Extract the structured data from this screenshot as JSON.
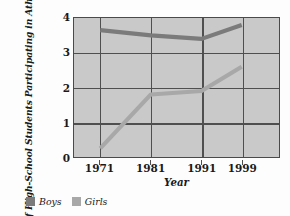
{
  "chart_data": {
    "type": "line",
    "title": "",
    "xlabel": "Year",
    "ylabel": "Number Of High-School Students Participating in Athletics (In Millions)",
    "x": [
      "1971",
      "1981",
      "1991",
      "1999"
    ],
    "categories": [
      "1971",
      "1981",
      "1991",
      "1999"
    ],
    "series": [
      {
        "name": "Boys",
        "values": [
          3.65,
          3.5,
          3.4,
          3.8
        ],
        "color": "#7b7b7b"
      },
      {
        "name": "Girls",
        "values": [
          0.25,
          1.8,
          1.9,
          2.6
        ],
        "color": "#a8a8a8"
      }
    ],
    "xlim": [
      1966,
      2004
    ],
    "ylim": [
      0,
      4
    ],
    "yticks": [
      "0",
      "1",
      "2",
      "3",
      "4"
    ],
    "ytick_values": [
      0,
      1,
      2,
      3,
      4
    ],
    "grid": true,
    "legend_position": "bottom-left",
    "plot_background": "#c9c9c9",
    "grid_color": "#4f4f4f",
    "axis_color": "#4a4a4a",
    "figure_background": "#fdfdfd"
  },
  "legend": {
    "items": [
      {
        "label": "Boys",
        "color": "#7b7b7b"
      },
      {
        "label": "Girls",
        "color": "#a8a8a8"
      }
    ]
  }
}
